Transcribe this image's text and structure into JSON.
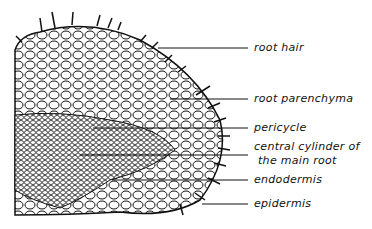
{
  "diagram": {
    "labels": [
      {
        "id": "root-hair",
        "text": "root hair",
        "x": 254,
        "y": 42,
        "line_from_x": 158,
        "line_y": 48
      },
      {
        "id": "root-parenchyma",
        "text": "root parenchyma",
        "x": 254,
        "y": 92,
        "line_from_x": 170,
        "line_y": 99
      },
      {
        "id": "pericycle",
        "text": "pericycle",
        "x": 254,
        "y": 122,
        "line_from_x": 93,
        "line_y": 128
      },
      {
        "id": "central-cylinder",
        "text": "central cylinder of",
        "text2": "the main root",
        "x": 254,
        "y": 143,
        "line_from_x": 80,
        "line_y": 155
      },
      {
        "id": "endodermis",
        "text": "endodermis",
        "x": 254,
        "y": 174,
        "line_from_x": 112,
        "line_y": 180
      },
      {
        "id": "epidermis",
        "text": "epidermis",
        "x": 254,
        "y": 198,
        "line_from_x": 202,
        "line_y": 204
      }
    ],
    "colors": {
      "ink": "#111111",
      "background": "#ffffff"
    }
  }
}
